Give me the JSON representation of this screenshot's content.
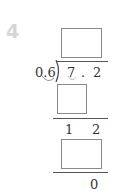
{
  "problem": {
    "number": "4"
  },
  "division": {
    "divisor": "0.6",
    "dividend": {
      "digit1": "7",
      "point": ".",
      "digit2": "2"
    },
    "quotient_box": "",
    "step1_product_box": "",
    "remainder1": {
      "digit1": "1",
      "digit2": "2"
    },
    "step2_product_box": "",
    "final_remainder": "0"
  }
}
